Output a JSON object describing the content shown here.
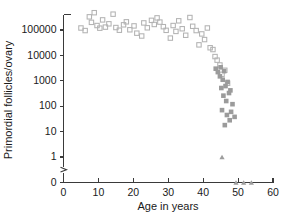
{
  "chart_data": {
    "type": "scatter",
    "title": "",
    "xlabel": "Age in years",
    "ylabel": "Primordial follicles/ovary",
    "xlim": [
      0,
      60
    ],
    "xticks": [
      0,
      10,
      20,
      30,
      40,
      50,
      60
    ],
    "xticklabels": [
      "0",
      "10",
      "20",
      "30",
      "40",
      "50",
      "60"
    ],
    "yscale": "log",
    "ylim": [
      1,
      1000000
    ],
    "yticks": [
      100000,
      10000,
      1000,
      100,
      10,
      1,
      0
    ],
    "yticklabels": [
      "100000",
      "10000",
      "1000",
      "100",
      "10",
      "1",
      "0"
    ],
    "y_axis_break": true,
    "y_axis_break_note": "broken axis between 1 and 0",
    "grid": false,
    "legend": "none",
    "series": [
      {
        "name": "open-squares",
        "marker": "open-square",
        "color": "#b3b3b3",
        "points": [
          [
            5.0,
            120000
          ],
          [
            6.2,
            95000
          ],
          [
            7.4,
            330000
          ],
          [
            8.0,
            200000
          ],
          [
            8.8,
            480000
          ],
          [
            9.6,
            150000
          ],
          [
            10.4,
            118000
          ],
          [
            11.2,
            250000
          ],
          [
            12.0,
            130000
          ],
          [
            13.0,
            175000
          ],
          [
            14.2,
            420000
          ],
          [
            15.0,
            125000
          ],
          [
            16.0,
            98000
          ],
          [
            17.2,
            160000
          ],
          [
            18.0,
            210000
          ],
          [
            19.0,
            102000
          ],
          [
            20.2,
            145000
          ],
          [
            21.0,
            75000
          ],
          [
            22.4,
            58000
          ],
          [
            23.0,
            190000
          ],
          [
            24.0,
            122000
          ],
          [
            25.2,
            240000
          ],
          [
            26.0,
            165000
          ],
          [
            26.8,
            300000
          ],
          [
            27.6,
            205000
          ],
          [
            28.6,
            135000
          ],
          [
            29.4,
            97000
          ],
          [
            30.6,
            48000
          ],
          [
            31.4,
            150000
          ],
          [
            32.2,
            88000
          ],
          [
            33.0,
            230000
          ],
          [
            34.0,
            112000
          ],
          [
            35.0,
            62000
          ],
          [
            36.2,
            310000
          ],
          [
            37.0,
            140000
          ],
          [
            38.0,
            95000
          ],
          [
            38.8,
            26000
          ],
          [
            39.6,
            70000
          ],
          [
            40.4,
            42000
          ],
          [
            41.2,
            120000
          ],
          [
            42.0,
            20000
          ],
          [
            42.8,
            17000
          ],
          [
            43.4,
            9000
          ],
          [
            44.0,
            6500
          ],
          [
            44.8,
            4200
          ],
          [
            45.4,
            1800
          ],
          [
            46.2,
            2600
          ],
          [
            47.0,
            800
          ]
        ]
      },
      {
        "name": "filled-squares",
        "marker": "filled-square",
        "color": "#9b9b9b",
        "points": [
          [
            43.6,
            3000
          ],
          [
            44.2,
            2200
          ],
          [
            44.8,
            1500
          ],
          [
            45.0,
            3400
          ],
          [
            45.6,
            1100
          ],
          [
            46.0,
            2400
          ],
          [
            46.4,
            620
          ],
          [
            47.0,
            900
          ],
          [
            47.4,
            330
          ],
          [
            45.2,
            520
          ],
          [
            45.8,
            260
          ],
          [
            46.6,
            160
          ],
          [
            47.8,
            420
          ],
          [
            48.4,
            120
          ],
          [
            45.4,
            70
          ],
          [
            46.8,
            45
          ],
          [
            47.6,
            28
          ],
          [
            46.2,
            18
          ],
          [
            48.0,
            60
          ],
          [
            49.0,
            38
          ]
        ]
      },
      {
        "name": "triangles",
        "marker": "triangle",
        "color": "#9d9d9d",
        "points": [
          [
            45.4,
            1
          ],
          [
            49.4,
            0
          ],
          [
            51.6,
            0
          ],
          [
            53.8,
            0
          ]
        ]
      }
    ]
  }
}
